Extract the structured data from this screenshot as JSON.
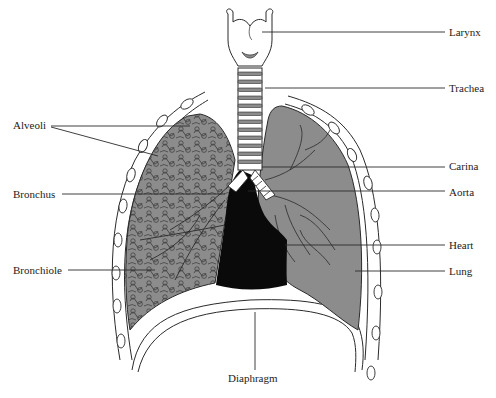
{
  "diagram": {
    "colors": {
      "lung_fill": "#8c8c8c",
      "heart_fill": "#0a0a0a",
      "outline": "#2a2a2a",
      "rib_fill": "#ffffff",
      "background": "#ffffff"
    },
    "labels": {
      "larynx": "Larynx",
      "trachea": "Trachea",
      "carina": "Carina",
      "aorta": "Aorta",
      "heart": "Heart",
      "lung": "Lung",
      "alveoli": "Alveoli",
      "bronchus": "Bronchus",
      "bronchiole": "Bronchiole",
      "diaphragm": "Diaphragm"
    },
    "label_sides": {
      "right": [
        "Larynx",
        "Trachea",
        "Carina",
        "Aorta",
        "Heart",
        "Lung"
      ],
      "left": [
        "Alveoli",
        "Bronchus",
        "Bronchiole"
      ],
      "bottom": [
        "Diaphragm"
      ]
    }
  }
}
